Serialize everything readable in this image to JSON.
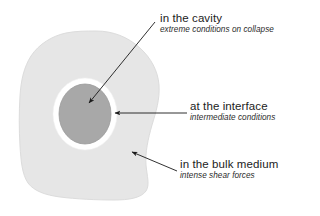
{
  "diagram": {
    "type": "annotated-schematic",
    "colors": {
      "bulk_medium_fill": "#e6e6e6",
      "bulk_medium_edge": "#dcdcdc",
      "interface_ring": "#ffffff",
      "cavity_fill": "#a8a8a8",
      "cavity_edge": "#9a9a9a",
      "arrow": "#1a1a1a",
      "text": "#222222",
      "background": "#ffffff"
    },
    "shapes": {
      "bulk_medium": {
        "name": "bulk-medium-blob",
        "description": "irregular rounded blob filling the left portion of the figure"
      },
      "interface_ring": {
        "name": "interface-ring",
        "description": "thick white annulus around the cavity",
        "cx": 85,
        "cy": 114,
        "rx": 32,
        "ry": 36
      },
      "cavity": {
        "name": "cavity-circle",
        "description": "medium grey filled circle at the centre",
        "cx": 85,
        "cy": 114,
        "rx": 26,
        "ry": 30
      }
    },
    "annotations": [
      {
        "id": "cavity",
        "title": "in the cavity",
        "subtitle": "extreme conditions on collapse",
        "arrow": {
          "from_x": 155,
          "from_y": 22,
          "to_x": 88,
          "to_y": 104,
          "target": "cavity-circle"
        }
      },
      {
        "id": "interface",
        "title": "at the interface",
        "subtitle": "intermediate conditions",
        "arrow": {
          "from_x": 187,
          "from_y": 113,
          "to_x": 114,
          "to_y": 113,
          "target": "interface-ring"
        }
      },
      {
        "id": "bulk",
        "title": "in the bulk medium",
        "subtitle": "intense shear forces",
        "arrow": {
          "from_x": 177,
          "from_y": 171,
          "to_x": 131,
          "to_y": 151,
          "target": "bulk-medium-blob"
        }
      }
    ]
  }
}
